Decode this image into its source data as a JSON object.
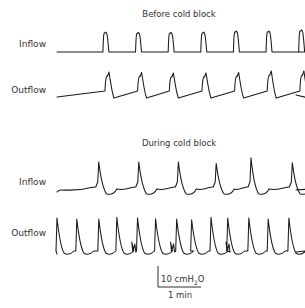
{
  "chart_data": {
    "type": "line",
    "panels": [
      {
        "title": "Before cold block",
        "series": [
          {
            "name": "Inflow",
            "kind": "square-pulse",
            "peak_times_min": [
              0.55,
              1.3,
              2.05,
              2.8,
              3.55,
              4.3,
              5.05
            ],
            "relative_peak_amplitude": [
              0.95,
              0.93,
              0.93,
              0.95,
              1.0,
              1.0,
              1.05
            ]
          },
          {
            "name": "Outflow",
            "kind": "ramp-spike",
            "peak_times_min": [
              0.62,
              1.37,
              2.1,
              2.85,
              3.6,
              4.35,
              5.1
            ],
            "relative_peak_amplitude": [
              1.0,
              0.98,
              0.95,
              0.95,
              0.98,
              1.05,
              1.05
            ]
          }
        ]
      },
      {
        "title": "During cold block",
        "series": [
          {
            "name": "Inflow",
            "kind": "spike-with-decay",
            "peak_times_min": [
              0.5,
              1.42,
              2.33,
              3.2,
              4.0,
              4.95
            ],
            "relative_peak_amplitude": [
              1.0,
              1.0,
              1.0,
              0.95,
              1.15,
              0.97
            ]
          },
          {
            "name": "Outflow",
            "kind": "rapid-spikes",
            "peak_times_min": [
              0.0,
              0.45,
              0.95,
              1.36,
              1.83,
              2.24,
              2.72,
              3.06,
              3.5,
              3.88,
              4.36,
              4.8,
              5.27
            ],
            "relative_peak_amplitude": [
              1.0,
              0.97,
              0.97,
              1.02,
              1.0,
              0.98,
              0.97,
              0.95,
              1.02,
              1.0,
              1.0,
              0.97,
              1.0
            ]
          }
        ]
      }
    ],
    "scale_bar": {
      "vertical": "10 cmH2O",
      "horizontal": "1 min"
    },
    "xlabel": "",
    "ylabel": ""
  },
  "labels": {
    "title_before": "Before cold block",
    "title_during": "During cold block",
    "inflow": "Inflow",
    "outflow": "Outflow",
    "scale_v_prefix": "10 cmH",
    "scale_v_sub": "2",
    "scale_v_suffix": "O",
    "scale_h": "1 min"
  }
}
